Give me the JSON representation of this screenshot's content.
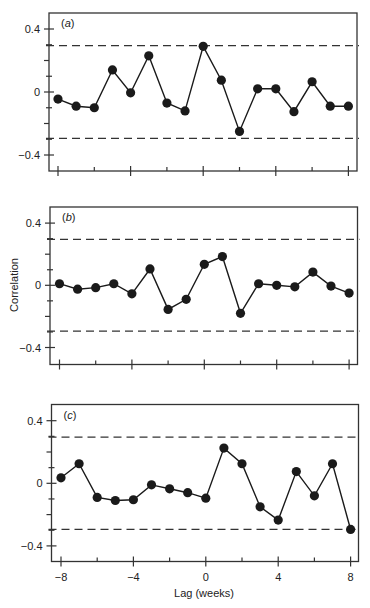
{
  "figure": {
    "ylabel": "Correlation",
    "xlabel": "Lag (weeks)",
    "line_color": "#1a1a1a",
    "marker_color": "#1a1a1a"
  },
  "chart_data": [
    {
      "type": "line",
      "panel": "(a)",
      "x": [
        -8,
        -7,
        -6,
        -5,
        -4,
        -3,
        -2,
        -1,
        0,
        1,
        2,
        3,
        4,
        5,
        6,
        7,
        8
      ],
      "values": [
        -0.045,
        -0.09,
        -0.1,
        0.14,
        -0.005,
        0.23,
        -0.07,
        -0.12,
        0.29,
        0.075,
        -0.25,
        0.02,
        0.02,
        -0.125,
        0.065,
        -0.09,
        -0.09
      ],
      "confidence_bounds": [
        0.295,
        -0.295
      ],
      "xlabel": "Lag (weeks)",
      "ylabel": "Correlation",
      "xlim": [
        -8.5,
        8.5
      ],
      "ylim": [
        -0.5,
        0.5
      ],
      "yticks": [
        0.4,
        0,
        -0.4
      ],
      "yticklabels": [
        "0.4",
        "0",
        "-0.4"
      ],
      "xticks": [
        -8,
        -4,
        0,
        4,
        8
      ],
      "xticklabels": [],
      "grid": false,
      "legend": null
    },
    {
      "type": "line",
      "panel": "(b)",
      "x": [
        -8,
        -7,
        -6,
        -5,
        -4,
        -3,
        -2,
        -1,
        0,
        1,
        2,
        3,
        4,
        5,
        6,
        7,
        8
      ],
      "values": [
        0.01,
        -0.025,
        -0.015,
        0.01,
        -0.055,
        0.105,
        -0.155,
        -0.09,
        0.135,
        0.185,
        -0.18,
        0.01,
        0.0,
        -0.01,
        0.085,
        -0.005,
        -0.05
      ],
      "confidence_bounds": [
        0.295,
        -0.295
      ],
      "xlabel": "Lag (weeks)",
      "ylabel": "Correlation",
      "xlim": [
        -8.5,
        8.5
      ],
      "ylim": [
        -0.5,
        0.5
      ],
      "yticks": [
        0.4,
        0,
        -0.4
      ],
      "yticklabels": [
        "0.4",
        "0",
        "-0.4"
      ],
      "xticks": [
        -8,
        -4,
        0,
        4,
        8
      ],
      "xticklabels": [],
      "grid": false,
      "legend": null
    },
    {
      "type": "line",
      "panel": "(c)",
      "x": [
        -8,
        -7,
        -6,
        -5,
        -4,
        -3,
        -2,
        -1,
        0,
        1,
        2,
        3,
        4,
        5,
        6,
        7,
        8
      ],
      "values": [
        0.035,
        0.125,
        -0.09,
        -0.11,
        -0.105,
        -0.01,
        -0.035,
        -0.06,
        -0.095,
        0.225,
        0.125,
        -0.15,
        -0.235,
        0.075,
        -0.08,
        0.125,
        -0.295
      ],
      "confidence_bounds": [
        0.295,
        -0.295
      ],
      "xlabel": "Lag (weeks)",
      "ylabel": "Correlation",
      "xlim": [
        -8.5,
        8.5
      ],
      "ylim": [
        -0.5,
        0.5
      ],
      "yticks": [
        0.4,
        0,
        -0.4
      ],
      "yticklabels": [
        "0.4",
        "0",
        "-0.4"
      ],
      "xticks": [
        -8,
        -4,
        0,
        4,
        8
      ],
      "xticklabels": [
        "-8",
        "-4",
        "0",
        "4",
        "8"
      ],
      "grid": false,
      "legend": null
    }
  ],
  "layout": {
    "panels": [
      {
        "left": 49,
        "right": 357,
        "top": 13,
        "bottom": 171,
        "x0": 58,
        "xstep": 18.15,
        "y0": 92,
        "ystep": 157.5
      },
      {
        "left": 50,
        "right": 357.5,
        "top": 207,
        "bottom": 364.5,
        "x0": 59.5,
        "xstep": 18.1,
        "y0": 285.3,
        "ystep": 155.5
      },
      {
        "left": 51.5,
        "right": 358.5,
        "top": 404.5,
        "bottom": 561.5,
        "x0": 61,
        "xstep": 18.1,
        "y0": 483.3,
        "ystep": 156.5
      }
    ]
  }
}
